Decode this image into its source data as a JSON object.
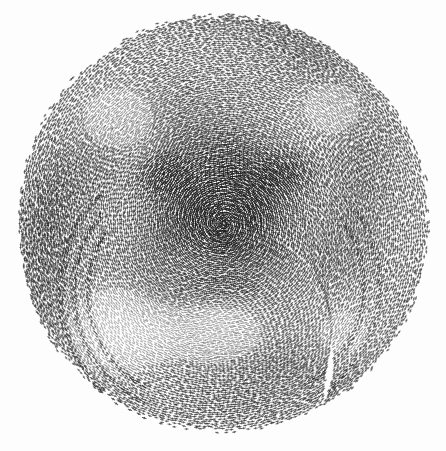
{
  "artwork": {
    "title": "Stippled Halftone Disc",
    "description": "Dense circular field of small dark dash marks on a warped polar grid forming a shaded portrait-like form",
    "medium": "generative halftone stipple",
    "background_color": "#fdfdfd",
    "ink_color": "#1c1c1c",
    "canvas": {
      "width": 446,
      "height": 451
    },
    "disc": {
      "center_x": 223,
      "center_y": 223,
      "radius_x": 209,
      "radius_y": 211,
      "edge_roughness": 7
    },
    "grid": {
      "type": "polar-spiral",
      "ring_count": 112,
      "ring_spacing": 1.88,
      "angular_step_px": 4.1,
      "spiral_twist": 0.16,
      "warp_amplitude": 5.5,
      "warp_frequency": 2.7,
      "jitter": 0.55
    },
    "mark": {
      "shape": "dash-cross",
      "min_length": 2.0,
      "max_length": 4.4,
      "thickness": 1.05,
      "min_opacity": 0.24,
      "max_opacity": 0.96
    },
    "shading_features": [
      {
        "name": "core-shadow",
        "cx": 223,
        "cy": 205,
        "rx": 105,
        "ry": 95,
        "weight": 0.52
      },
      {
        "name": "left-eye-socket",
        "cx": 163,
        "cy": 175,
        "rx": 42,
        "ry": 33,
        "weight": 0.3
      },
      {
        "name": "right-eye-socket",
        "cx": 288,
        "cy": 172,
        "rx": 42,
        "ry": 33,
        "weight": 0.3
      },
      {
        "name": "nose-bridge",
        "cx": 226,
        "cy": 212,
        "rx": 26,
        "ry": 52,
        "weight": 0.22
      },
      {
        "name": "mouth-shadow",
        "cx": 223,
        "cy": 288,
        "rx": 62,
        "ry": 26,
        "weight": 0.2
      },
      {
        "name": "upper-left-highlight",
        "cx": 120,
        "cy": 120,
        "rx": 70,
        "ry": 62,
        "weight": -0.26
      },
      {
        "name": "upper-right-highlight",
        "cx": 330,
        "cy": 110,
        "rx": 66,
        "ry": 58,
        "weight": -0.22
      },
      {
        "name": "chin-highlight",
        "cx": 212,
        "cy": 332,
        "rx": 92,
        "ry": 54,
        "weight": -0.34
      },
      {
        "name": "lower-left-highlight",
        "cx": 118,
        "cy": 330,
        "rx": 80,
        "ry": 70,
        "weight": -0.4
      },
      {
        "name": "lower-right-falloff",
        "cx": 340,
        "cy": 330,
        "rx": 78,
        "ry": 66,
        "weight": -0.18
      },
      {
        "name": "rim-left",
        "cx": 46,
        "cy": 220,
        "rx": 44,
        "ry": 98,
        "weight": 0.14
      },
      {
        "name": "rim-bottom",
        "cx": 230,
        "cy": 408,
        "rx": 110,
        "ry": 34,
        "weight": 0.12
      }
    ],
    "arc_bands": [
      {
        "name": "lower-left-band-1",
        "cx": 196,
        "cy": 292,
        "radius": 108,
        "width": 4.0,
        "start_deg": 118,
        "end_deg": 214,
        "weight": 0.34
      },
      {
        "name": "lower-left-band-2",
        "cx": 196,
        "cy": 292,
        "radius": 122,
        "width": 4.0,
        "start_deg": 114,
        "end_deg": 220,
        "weight": 0.3
      },
      {
        "name": "lower-left-band-3",
        "cx": 196,
        "cy": 292,
        "radius": 136,
        "width": 4.5,
        "start_deg": 112,
        "end_deg": 226,
        "weight": 0.26
      },
      {
        "name": "lower-right-band-1",
        "cx": 252,
        "cy": 286,
        "radius": 112,
        "width": 4.0,
        "start_deg": -34,
        "end_deg": 62,
        "weight": 0.24
      },
      {
        "name": "lower-right-band-2",
        "cx": 252,
        "cy": 286,
        "radius": 128,
        "width": 4.0,
        "start_deg": -38,
        "end_deg": 66,
        "weight": 0.2
      }
    ],
    "swirl_centers": [
      {
        "name": "swirl-upper-left",
        "cx": 168,
        "cy": 150,
        "strength": 0.62,
        "falloff": 88
      },
      {
        "name": "swirl-upper-right",
        "cx": 296,
        "cy": 150,
        "strength": -0.58,
        "falloff": 88
      },
      {
        "name": "swirl-core",
        "cx": 223,
        "cy": 226,
        "strength": 0.45,
        "falloff": 120
      },
      {
        "name": "swirl-lower-left",
        "cx": 140,
        "cy": 318,
        "strength": -0.7,
        "falloff": 100
      },
      {
        "name": "swirl-lower-right",
        "cx": 310,
        "cy": 318,
        "strength": 0.55,
        "falloff": 100
      }
    ],
    "random_seed": 20240607
  }
}
